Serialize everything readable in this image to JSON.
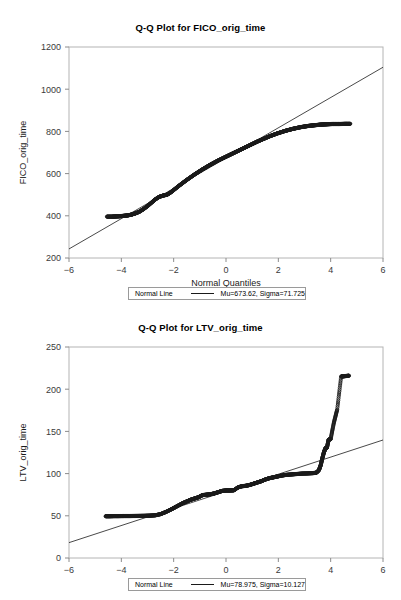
{
  "page": {
    "background": "#ffffff",
    "width": 401,
    "height": 600
  },
  "charts": [
    {
      "id": "chart-1",
      "title": "Q-Q Plot for FICO_orig_time",
      "xlabel": "Normal Quantiles",
      "ylabel": "FICO_orig_time",
      "legend": {
        "label": "Normal Line",
        "stats": "Mu=673.62, Sigma=71.725"
      }
    },
    {
      "id": "chart-2",
      "title": "Q-Q Plot for LTV_orig_time",
      "xlabel": "Normal Quantiles",
      "ylabel": "LTV_orig_time",
      "legend": {
        "label": "Normal Line",
        "stats": "Mu=78.975, Sigma=10.127"
      }
    }
  ],
  "chart_data": [
    {
      "type": "scatter",
      "title": "Q-Q Plot for FICO_orig_time",
      "xlabel": "Normal Quantiles",
      "ylabel": "FICO_orig_time",
      "xlim": [
        -6,
        6
      ],
      "ylim": [
        200,
        1200
      ],
      "xticks": [
        -6,
        -4,
        -2,
        0,
        2,
        4,
        6
      ],
      "yticks": [
        200,
        400,
        600,
        800,
        1000,
        1200
      ],
      "grid": false,
      "legend_position": "below-axis",
      "series": [
        {
          "name": "Quantile points",
          "marker": "open-circle",
          "color": "#1a1a1a",
          "x": [
            -4.55,
            -4.35,
            -4.2,
            -4.05,
            -3.9,
            -3.75,
            -3.6,
            -3.45,
            -3.3,
            -3.15,
            -3.0,
            -2.85,
            -2.7,
            -2.55,
            -2.4,
            -2.25,
            -2.1,
            -1.95,
            -1.8,
            -1.65,
            -1.5,
            -1.35,
            -1.2,
            -1.05,
            -0.9,
            -0.75,
            -0.6,
            -0.45,
            -0.3,
            -0.15,
            0.0,
            0.15,
            0.3,
            0.45,
            0.6,
            0.75,
            0.9,
            1.05,
            1.2,
            1.35,
            1.5,
            1.65,
            1.8,
            1.95,
            2.1,
            2.25,
            2.4,
            2.55,
            2.7,
            2.85,
            3.0,
            3.15,
            3.3,
            3.45,
            3.6,
            3.75,
            3.9,
            4.05,
            4.2,
            4.35,
            4.55,
            4.75
          ],
          "y": [
            396,
            396,
            397,
            398,
            400,
            402,
            406,
            412,
            420,
            432,
            446,
            462,
            478,
            490,
            496,
            500,
            512,
            527,
            542,
            556,
            570,
            583,
            596,
            608,
            620,
            631,
            642,
            652,
            662,
            671,
            680,
            689,
            698,
            707,
            716,
            725,
            734,
            743,
            752,
            760,
            768,
            776,
            783,
            790,
            796,
            802,
            807,
            812,
            816,
            820,
            823,
            826,
            828,
            830,
            832,
            833,
            834,
            835,
            835,
            835,
            836,
            836
          ]
        },
        {
          "name": "Normal Line",
          "marker": "line",
          "color": "#1a1a1a",
          "x": [
            -6,
            6
          ],
          "y": [
            243,
            1104
          ]
        }
      ]
    },
    {
      "type": "scatter",
      "title": "Q-Q Plot for LTV_orig_time",
      "xlabel": "Normal Quantiles",
      "ylabel": "LTV_orig_time",
      "xlim": [
        -6,
        6
      ],
      "ylim": [
        0,
        250
      ],
      "xticks": [
        -6,
        -4,
        -2,
        0,
        2,
        4,
        6
      ],
      "yticks": [
        0,
        50,
        100,
        150,
        200,
        250
      ],
      "grid": false,
      "legend_position": "below-axis",
      "series": [
        {
          "name": "Quantile points",
          "marker": "open-circle",
          "color": "#1a1a1a",
          "x": [
            -4.6,
            -4.45,
            -4.3,
            -4.1,
            -3.9,
            -3.7,
            -3.5,
            -3.3,
            -3.1,
            -2.9,
            -2.7,
            -2.5,
            -2.3,
            -2.1,
            -1.95,
            -1.8,
            -1.65,
            -1.5,
            -1.35,
            -1.2,
            -1.05,
            -0.9,
            -0.75,
            -0.6,
            -0.45,
            -0.3,
            -0.15,
            0.0,
            0.15,
            0.3,
            0.45,
            0.6,
            0.75,
            0.9,
            1.05,
            1.2,
            1.35,
            1.5,
            1.65,
            1.8,
            1.95,
            2.1,
            2.3,
            2.5,
            2.7,
            2.9,
            3.1,
            3.3,
            3.45,
            3.55,
            3.62,
            3.68,
            3.74,
            3.8,
            3.86,
            3.92,
            4.0,
            4.12,
            4.25,
            4.4,
            4.55,
            4.7
          ],
          "y": [
            49.5,
            49.5,
            49.6,
            49.6,
            49.7,
            49.7,
            49.8,
            49.9,
            50.0,
            50.2,
            50.6,
            52.0,
            54.5,
            57.5,
            60.0,
            62.5,
            65.0,
            67.0,
            69.0,
            70.5,
            72.0,
            74.5,
            75.0,
            75.5,
            76.5,
            78.0,
            79.5,
            80.0,
            80.0,
            80.2,
            83.5,
            85.0,
            85.5,
            86.5,
            88.0,
            89.5,
            91.0,
            93.0,
            94.5,
            95.5,
            96.5,
            97.5,
            98.5,
            99.0,
            99.5,
            100.0,
            100.2,
            100.5,
            101.0,
            104.0,
            110.0,
            118.0,
            125.0,
            130.0,
            131.0,
            140.0,
            141.0,
            160.0,
            176.0,
            215.0,
            215.5,
            216.0
          ]
        },
        {
          "name": "Normal Line",
          "marker": "line",
          "color": "#1a1a1a",
          "x": [
            -6,
            6
          ],
          "y": [
            18.2,
            139.8
          ]
        }
      ]
    }
  ]
}
